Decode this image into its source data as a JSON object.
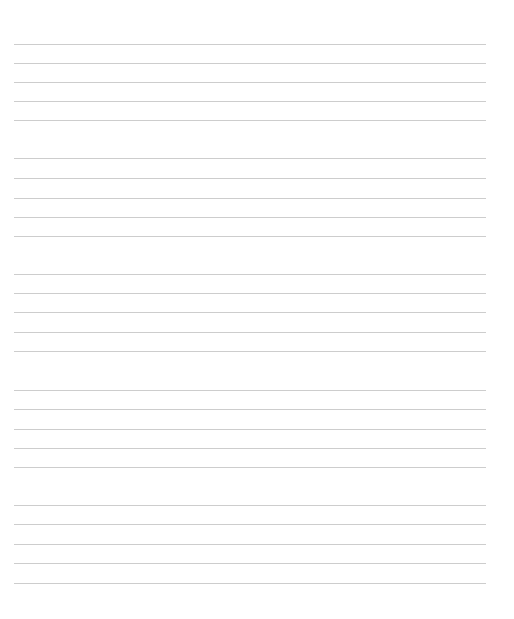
{
  "document": {
    "type": "blank-manuscript-paper",
    "staff_count": 5,
    "lines_per_staff": 5,
    "line_color": "#cdcdcd",
    "background_color": "#ffffff",
    "staves": [
      {
        "top": 44,
        "line_offsets": [
          0,
          19,
          38,
          57,
          76
        ]
      },
      {
        "top": 158,
        "line_offsets": [
          0,
          20,
          40,
          59,
          78
        ]
      },
      {
        "top": 274,
        "line_offsets": [
          0,
          19,
          38,
          58,
          77
        ]
      },
      {
        "top": 390,
        "line_offsets": [
          0,
          19,
          39,
          58,
          77
        ]
      },
      {
        "top": 505,
        "line_offsets": [
          0,
          19,
          39,
          58,
          78
        ]
      }
    ]
  }
}
